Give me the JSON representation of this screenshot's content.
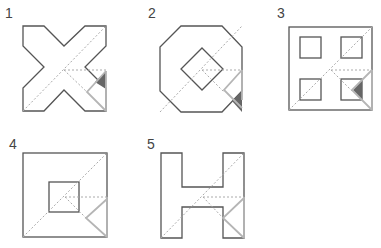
{
  "figure": {
    "colors": {
      "outline": "#555555",
      "dashed": "#aaaaaa",
      "fold": "#b5b5b5",
      "fold_dark": "#666666"
    },
    "shapes": [
      {
        "label": "1",
        "shape": "X-shape cross",
        "fold_shading": "dark triangle above fold"
      },
      {
        "label": "2",
        "shape": "octagon with diamond hole",
        "fold_shading": "dark triangle below fold"
      },
      {
        "label": "3",
        "shape": "square with four square holes",
        "fold_shading": "dark triangle inside bottom-right hole"
      },
      {
        "label": "4",
        "shape": "square with central square hole",
        "fold_shading": "none"
      },
      {
        "label": "5",
        "shape": "H-shape",
        "fold_shading": "none"
      }
    ]
  }
}
